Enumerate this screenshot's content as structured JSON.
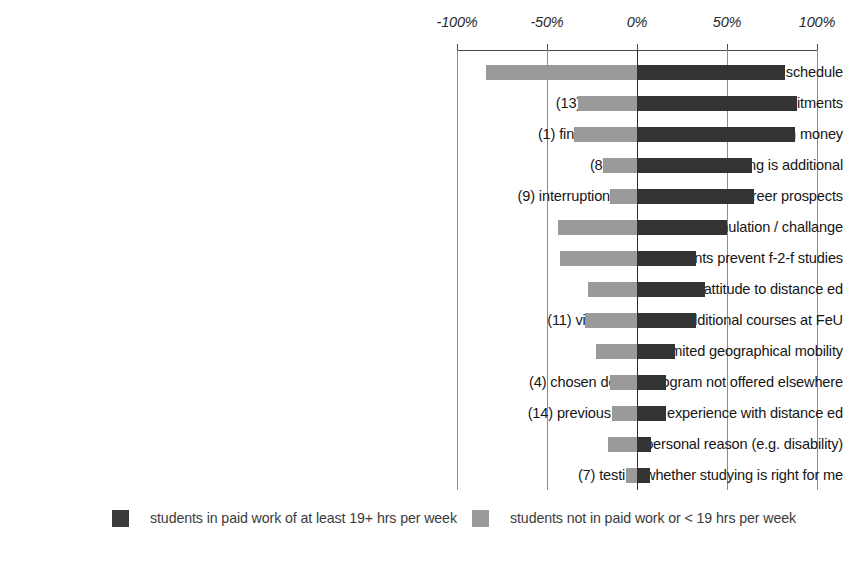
{
  "chart_data": {
    "type": "bar",
    "title": "",
    "subtitle": "",
    "orientation": "horizontal",
    "layout": "diverging-bidirectional",
    "xlabel": "",
    "ylabel": "",
    "xlim": [
      -100,
      100
    ],
    "grid": true,
    "legend_position": "bottom",
    "axis_ticks": [
      {
        "value": -100,
        "label": "-100%"
      },
      {
        "value": -50,
        "label": "-50%"
      },
      {
        "value": 0,
        "label": "0%"
      },
      {
        "value": 50,
        "label": "50%"
      },
      {
        "value": 100,
        "label": "100%"
      }
    ],
    "categories": [
      "(2) flexibility of time / no classroom schedule",
      "(13) more compatible with work commitments",
      "(1) financial need / must continue to earn money",
      "(8) job comes first, studying is additional",
      "(9) interruption of worl jeopardizes career prospects",
      "(5) intellectual stimulation / challange",
      "(3) family commitments prevent f-2-f studies",
      "(6) positive attitude to distance ed",
      "(11) visiting student / additional courses at FeU",
      "(10) limited geographical mobility",
      "(4) chosen degree program not offered elsewhere",
      "(14) previous positive experience with distance ed",
      "(12) personal reason (e.g. disability)",
      "(7) testing whether studying is right for me"
    ],
    "series": [
      {
        "name": "students in paid work of at least 19+ hrs per week",
        "color": "#333333",
        "direction": "right",
        "values": [
          82,
          89,
          88,
          64,
          65,
          50,
          33,
          38,
          33,
          21,
          16,
          16,
          8,
          7
        ]
      },
      {
        "name": "students not in paid work or < 19 hrs per week",
        "color": "#9a9a9a",
        "direction": "left",
        "values": [
          -84,
          -33,
          -35,
          -19,
          -15,
          -44,
          -43,
          -27,
          -29,
          -23,
          -15,
          -14,
          -16,
          -6
        ]
      }
    ],
    "legend": [
      {
        "label": "students in paid work of at least 19+ hrs per week",
        "color": "#333333"
      },
      {
        "label": "students not in paid work or < 19 hrs per week",
        "color": "#9a9a9a"
      }
    ]
  }
}
